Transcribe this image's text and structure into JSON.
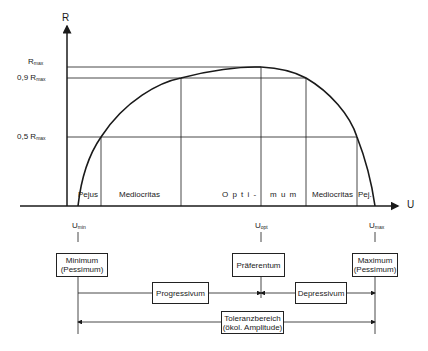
{
  "axes": {
    "y_label": "R",
    "x_label": "U",
    "y_ticks": [
      {
        "base": "R",
        "sub": "max",
        "prefix": ""
      },
      {
        "base": "R",
        "sub": "max",
        "prefix": "0,9 "
      },
      {
        "base": "R",
        "sub": "max",
        "prefix": "0,5 "
      }
    ],
    "x_ticks": [
      {
        "base": "U",
        "sub": "min"
      },
      {
        "base": "U",
        "sub": "opt"
      },
      {
        "base": "U",
        "sub": "max"
      }
    ]
  },
  "zones": [
    {
      "label": "Pejus"
    },
    {
      "label": "Mediocritas"
    },
    {
      "label": "O p t i -"
    },
    {
      "label": "m u m"
    },
    {
      "label": "Mediocritas"
    },
    {
      "label": "Pej."
    }
  ],
  "boxes": {
    "minimum": {
      "line1": "Minimum",
      "line2": "(Pessimum)"
    },
    "optimum": {
      "line1": "Präferentum"
    },
    "maximum": {
      "line1": "Maximum",
      "line2": "(Pessimum)"
    },
    "progressivum": {
      "line1": "Progressivum"
    },
    "depressivum": {
      "line1": "Depressivum"
    },
    "toleranz": {
      "line1": "Toleranzbereich",
      "line2": "(ökol. Amplitude)"
    }
  },
  "colors": {
    "line": "#1a1a1a",
    "background": "#ffffff"
  }
}
